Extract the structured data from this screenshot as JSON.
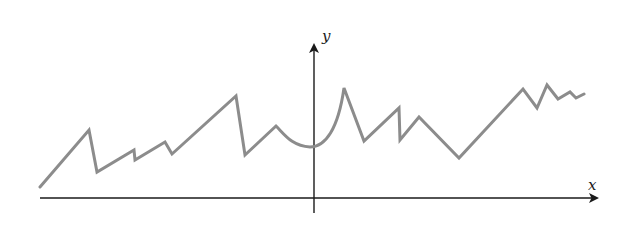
{
  "figure": {
    "width": 624,
    "height": 232,
    "background": "#ffffff",
    "axes": {
      "color": "#1a1a1a",
      "x_axis": {
        "label": "x",
        "y": 198,
        "x_start": 40,
        "x_end": 597,
        "label_pos": [
          588,
          190
        ]
      },
      "y_axis": {
        "label": "y",
        "x": 314,
        "y_start": 213,
        "y_end": 45,
        "label_pos": [
          322,
          41
        ]
      }
    },
    "curve": {
      "color": "#8c8c8c",
      "stroke_width": 3,
      "description": "continuous jagged curve with sharp corners and a smooth cusp-shaped dip near the y-axis",
      "path": "M40,187 L89,130 L97,172 L134,150 L135,160 L165,142 L172,154 L236,96 L245,155 L276,126 C285,135 292,146 310,147 C325,147 338,130 344,88 L364,141 L399,108 L400,140 L419,117 L459,158 L523,89 L537,108 L547,85 L558,99 L570,92 L576,98 L584,94"
    }
  }
}
